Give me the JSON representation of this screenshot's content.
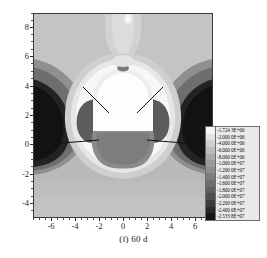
{
  "caption": "(f) 60 d",
  "axes": {
    "x_ticks": [
      "-6",
      "-4",
      "-2",
      "0",
      "2",
      "4",
      "6"
    ],
    "y_ticks": [
      "8",
      "6",
      "4",
      "2",
      "0",
      "-2",
      "-4"
    ],
    "xlim": [
      -7.5,
      7.5
    ],
    "ylim": [
      -5.0,
      9.0
    ]
  },
  "legend": {
    "levels": [
      "-1.724 3E+06",
      "-2.000 0E+06",
      "-4.000 0E+06",
      "-6.000 0E+06",
      "-8.000 0E+06",
      "-1.000 0E+07",
      "-1.200 0E+07",
      "-1.400 0E+07",
      "-1.600 0E+07",
      "-1.800 0E+07",
      "-2.000 0E+07",
      "-2.200 0E+07",
      "-2.400 0E+07",
      "-2.533 8E+07"
    ],
    "colors": [
      "#f2f2f2",
      "#e2e2e2",
      "#cfcfcf",
      "#bcbcbc",
      "#ababab",
      "#9b9b9b",
      "#8d8d8d",
      "#7e7e7e",
      "#6f6f6f",
      "#5f5f5f",
      "#4e4e4e",
      "#3b3b3b",
      "#282828",
      "#151515"
    ]
  },
  "chart_data": {
    "type": "heatmap",
    "title": "(f) 60 d",
    "subtitle": "",
    "xlabel": "",
    "ylabel": "",
    "xlim": [
      -7.5,
      7.5
    ],
    "ylim": [
      -5.0,
      9.0
    ],
    "x_tick_values": [
      -6,
      -4,
      -2,
      0,
      2,
      4,
      6
    ],
    "y_tick_values": [
      8,
      6,
      4,
      2,
      0,
      -2,
      -4
    ],
    "grid": false,
    "legend_position": "inside-right",
    "colorbar_label": "",
    "contour_levels": [
      -1724300,
      -2000000,
      -4000000,
      -6000000,
      -8000000,
      -10000000,
      -12000000,
      -14000000,
      -16000000,
      -18000000,
      -20000000,
      -22000000,
      -24000000,
      -25338000
    ],
    "colormap": "grayscale-reversed",
    "value_min": -25338000,
    "value_max": -1724300,
    "annotations": [
      {
        "label": "leader-line",
        "from": [
          -3.4,
          3.0
        ],
        "to": [
          -1.6,
          2.0
        ]
      },
      {
        "label": "leader-line",
        "from": [
          -6.1,
          0.1
        ],
        "to": [
          -2.0,
          0.3
        ]
      },
      {
        "label": "leader-line",
        "from": [
          3.4,
          3.0
        ],
        "to": [
          1.6,
          2.0
        ]
      },
      {
        "label": "leader-line",
        "from": [
          6.1,
          0.1
        ],
        "to": [
          2.0,
          0.3
        ]
      }
    ]
  }
}
